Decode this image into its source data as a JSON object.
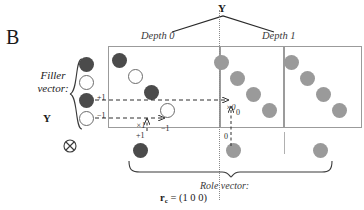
{
  "figure": {
    "panel_letter": "B",
    "top_axis_label": "Y",
    "left_label_line1": "Filler",
    "left_label_line2": "vector:",
    "left_label_symbol": "Y",
    "tensor_symbol": "⊗",
    "depth_labels": [
      {
        "text": "Depth 0"
      },
      {
        "text": "Depth 1"
      }
    ],
    "role_label": "Role vector:",
    "role_formula_r": "r",
    "role_formula_sub": "c",
    "role_formula_rest": " = (1 0 0)"
  },
  "annotations": [
    {
      "name": "plus-one-left",
      "text": "+1"
    },
    {
      "name": "minus-one-left",
      "text": "−1"
    },
    {
      "name": "times-one",
      "text": "×1"
    },
    {
      "name": "minus-one-mid",
      "text": "−1"
    },
    {
      "name": "plus-one-bottom",
      "text": "+1"
    },
    {
      "name": "times-zero",
      "text": "×0"
    },
    {
      "name": "zero-right",
      "text": "0"
    },
    {
      "name": "zero-bottom",
      "text": "0"
    }
  ],
  "colors": {
    "dark_node": "#4b4b4b",
    "gray_node": "#9a9a9a",
    "open_node_stroke": "#6b6b6b",
    "box_border": "#9b9b9b",
    "dashed_arrow": "#3a3a3a",
    "divider_dotted": "#8a8a8a",
    "background": "#ffffff"
  },
  "nodes": {
    "filler_column": [
      {
        "style": "dark",
        "x": 86,
        "y": 64
      },
      {
        "style": "open",
        "x": 86,
        "y": 82
      },
      {
        "style": "dark",
        "x": 86,
        "y": 100
      },
      {
        "style": "open",
        "x": 86,
        "y": 118
      }
    ],
    "depth0": [
      {
        "style": "dark",
        "x": 119,
        "y": 60
      },
      {
        "style": "open",
        "x": 135,
        "y": 76
      },
      {
        "style": "dark",
        "x": 151,
        "y": 92
      },
      {
        "style": "open",
        "x": 167,
        "y": 110
      }
    ],
    "depth1_group_a": [
      {
        "style": "gray",
        "x": 221,
        "y": 62
      },
      {
        "style": "gray",
        "x": 237,
        "y": 78
      },
      {
        "style": "gray",
        "x": 253,
        "y": 94
      },
      {
        "style": "gray",
        "x": 269,
        "y": 110
      }
    ],
    "depth1_group_b": [
      {
        "style": "gray",
        "x": 291,
        "y": 62
      },
      {
        "style": "gray",
        "x": 307,
        "y": 78
      },
      {
        "style": "gray",
        "x": 323,
        "y": 94
      },
      {
        "style": "gray",
        "x": 339,
        "y": 110
      }
    ],
    "bottom_row": [
      {
        "style": "dark",
        "x": 140,
        "y": 150
      },
      {
        "style": "gray",
        "x": 233,
        "y": 150
      },
      {
        "style": "gray",
        "x": 320,
        "y": 150
      }
    ]
  }
}
